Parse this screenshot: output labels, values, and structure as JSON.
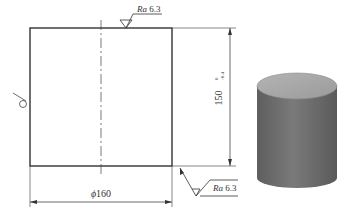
{
  "drawing": {
    "top_roughness": {
      "param": "Ra",
      "value": "6.3"
    },
    "corner_roughness": {
      "param": "Ra",
      "value": "6.3"
    },
    "height_dim": {
      "value": "150",
      "tolerance_upper": "0",
      "tolerance_lower": "-0.4"
    },
    "diameter_dim": {
      "symbol": "ϕ",
      "value": "160"
    },
    "left_symbol": "surface-finish-circle"
  },
  "view_3d": {
    "shape": "cylinder",
    "side_color": "#6f6f6f",
    "top_color": "#a8a8a8"
  }
}
